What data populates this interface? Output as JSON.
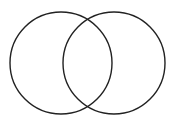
{
  "diagram": {
    "type": "venn",
    "background": "#ffffff",
    "stroke_color": "#222222",
    "stroke_width": 1.4,
    "circles": [
      {
        "name": "left-set",
        "cx": 61,
        "cy": 63,
        "r": 51
      },
      {
        "name": "right-set",
        "cx": 114,
        "cy": 63,
        "r": 51
      }
    ]
  }
}
